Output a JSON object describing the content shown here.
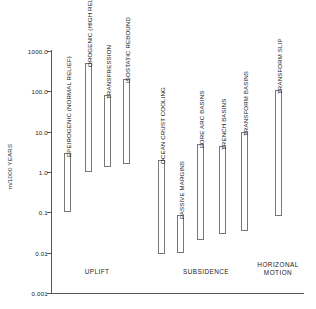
{
  "chart_data": {
    "type": "bar",
    "orientation": "vertical-range",
    "title": "",
    "xlabel": "",
    "ylabel": "m/1000 YEARS",
    "yscale": "log",
    "ylim": [
      0.001,
      1000.0
    ],
    "grid": false,
    "legend": null,
    "ytick_labels": [
      "1000.0",
      "100.0",
      "10.0",
      "1.0",
      "0.1",
      "0.01",
      "0.001"
    ],
    "ytick_values": [
      1000.0,
      100.0,
      10.0,
      1.0,
      0.1,
      0.01,
      0.001
    ],
    "categories": [
      "EPEIROGENIC (NORMAL RELIEF)",
      "OROGENIC (HIGH RELIEF)",
      "TRANSPRESSION",
      "ISOSTATIC REBOUND",
      "OCEAN CRUST COOLING",
      "PASSIVE MARGINS",
      "FORE ARC BASINS",
      "TRENCH BASINS",
      "TRANSFORM BASINS",
      "TRANSFORM SLIP"
    ],
    "bars": [
      {
        "label": "EPEIROGENIC (NORMAL RELIEF)",
        "group": "UPLIFT",
        "low": 0.1,
        "high": 3.0
      },
      {
        "label": "OROGENIC (HIGH RELIEF)",
        "group": "UPLIFT",
        "low": 1.0,
        "high": 500.0
      },
      {
        "label": "TRANSPRESSION",
        "group": "UPLIFT",
        "low": 1.3,
        "high": 80.0
      },
      {
        "label": "ISOSTATIC REBOUND",
        "group": "UPLIFT",
        "low": 1.6,
        "high": 200.0
      },
      {
        "label": "OCEAN CRUST COOLING",
        "group": "SUBSIDENCE",
        "low": 0.009,
        "high": 2.0
      },
      {
        "label": "PASSIVE MARGINS",
        "group": "SUBSIDENCE",
        "low": 0.0095,
        "high": 0.085
      },
      {
        "label": "FORE ARC BASINS",
        "group": "SUBSIDENCE",
        "low": 0.021,
        "high": 5.0
      },
      {
        "label": "TRENCH BASINS",
        "group": "SUBSIDENCE",
        "low": 0.028,
        "high": 4.5
      },
      {
        "label": "TRANSFORM BASINS",
        "group": "SUBSIDENCE",
        "low": 0.034,
        "high": 10.0
      },
      {
        "label": "TRANSFORM SLIP",
        "group": "HORIZONAL MOTION",
        "low": 0.08,
        "high": 110.0
      }
    ],
    "groups": [
      {
        "name": "UPLIFT",
        "caption": "UPLIFT"
      },
      {
        "name": "SUBSIDENCE",
        "caption": "SUBSIDENCE"
      },
      {
        "name": "HORIZONAL MOTION",
        "caption": "HORIZONAL\nMOTION"
      }
    ]
  },
  "axis": {
    "y_title": "m/1000 YEARS",
    "ticks": [
      {
        "label": "1000.0"
      },
      {
        "label": "100.0"
      },
      {
        "label": "10.0"
      },
      {
        "label": "1.0"
      },
      {
        "label": "0.1"
      },
      {
        "label": "0.01"
      },
      {
        "label": "0.001"
      }
    ]
  },
  "bar_labels": [
    "EPEIROGENIC (NORMAL RELIEF)",
    "OROGENIC (HIGH RELIEF)",
    "TRANSPRESSION",
    "ISOSTATIC REBOUND",
    "OCEAN CRUST COOLING",
    "PASSIVE MARGINS",
    "FORE ARC BASINS",
    "TRENCH BASINS",
    "TRANSFORM BASINS",
    "TRANSFORM SLIP"
  ],
  "group_captions": [
    "UPLIFT",
    "SUBSIDENCE",
    "HORIZONAL\nMOTION"
  ],
  "colors": {
    "bar_stroke": "#777777",
    "bar_fill": "#ffffff",
    "axis": "#555555",
    "text": "#1a1a1a",
    "background": "#ffffff"
  }
}
